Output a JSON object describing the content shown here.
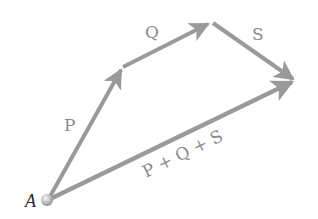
{
  "diagram": {
    "origin_label": "A",
    "vectors": [
      {
        "id": "P",
        "label": "P",
        "from": [
          48,
          200
        ],
        "to": [
          122,
          68
        ]
      },
      {
        "id": "Q",
        "label": "Q",
        "from": [
          122,
          68
        ],
        "to": [
          210,
          23
        ]
      },
      {
        "id": "S",
        "label": "S",
        "from": [
          212,
          23
        ],
        "to": [
          295,
          80
        ]
      },
      {
        "id": "resultant",
        "label": "P + Q + S",
        "from": [
          48,
          200
        ],
        "to": [
          295,
          80
        ]
      }
    ],
    "colors": {
      "arrow": "#9a9a9a",
      "label": "#8a8a8a",
      "origin_label": "#2b2b2b",
      "origin_point": "#b5b5b5"
    }
  }
}
